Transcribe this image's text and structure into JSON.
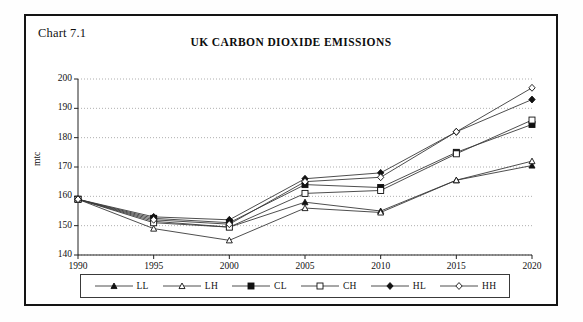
{
  "chart_label": "Chart 7.1",
  "title": "UK CARBON DIOXIDE EMISSIONS",
  "axis": {
    "ylabel": "mtc",
    "yticks": [
      "140",
      "150",
      "160",
      "170",
      "180",
      "190",
      "200"
    ],
    "xticks": [
      "1990",
      "1995",
      "2000",
      "2005",
      "2010",
      "2015",
      "2020"
    ]
  },
  "legend": [
    {
      "label": "LL",
      "marker": "filled-triangle"
    },
    {
      "label": "LH",
      "marker": "open-triangle"
    },
    {
      "label": "CL",
      "marker": "filled-square"
    },
    {
      "label": "CH",
      "marker": "open-square"
    },
    {
      "label": "HL",
      "marker": "filled-diamond"
    },
    {
      "label": "HH",
      "marker": "open-diamond"
    }
  ],
  "chart_data": {
    "type": "line",
    "title": "UK CARBON DIOXIDE EMISSIONS",
    "xlabel": "",
    "ylabel": "mtc",
    "x": [
      1990,
      1995,
      2000,
      2005,
      2010,
      2015,
      2020
    ],
    "xlim": [
      1990,
      2020
    ],
    "ylim": [
      140,
      200
    ],
    "ytick_step": 10,
    "grid": true,
    "legend_position": "bottom",
    "series": [
      {
        "name": "LL",
        "marker": "filled-triangle",
        "values": [
          159,
          151.5,
          149.5,
          158,
          155,
          165.5,
          170.5
        ]
      },
      {
        "name": "LH",
        "marker": "open-triangle",
        "values": [
          159,
          149,
          145,
          156,
          154.5,
          165.5,
          172
        ]
      },
      {
        "name": "CL",
        "marker": "filled-square",
        "values": [
          159,
          152.5,
          151,
          164,
          163,
          175,
          184.5
        ]
      },
      {
        "name": "CH",
        "marker": "open-square",
        "values": [
          159,
          151,
          149.5,
          161,
          162,
          174.5,
          186
        ]
      },
      {
        "name": "HL",
        "marker": "filled-diamond",
        "values": [
          159,
          153,
          152,
          166,
          168,
          182,
          193
        ]
      },
      {
        "name": "HH",
        "marker": "open-diamond",
        "values": [
          159,
          152,
          150.5,
          165,
          166.5,
          182,
          197
        ]
      }
    ]
  },
  "colors": {
    "frame": "#141414",
    "line": "#3a3a3a",
    "grid": "#9a9a9a",
    "text": "#111111"
  }
}
